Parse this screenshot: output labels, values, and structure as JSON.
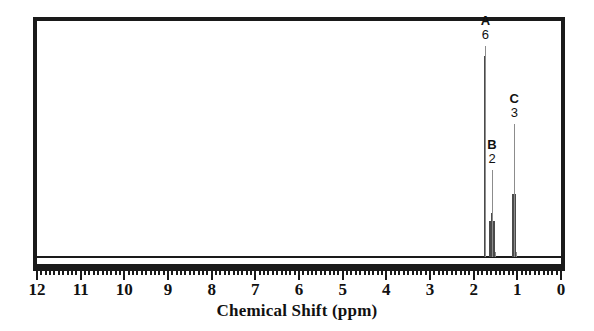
{
  "chart_data": {
    "type": "line",
    "title": "",
    "xlabel": "Chemical Shift (ppm)",
    "ylabel": "",
    "xlim": [
      12,
      0
    ],
    "x_axis_direction": "reversed",
    "grid": false,
    "legend": "none",
    "tick_labels": [
      "12",
      "11",
      "10",
      "9",
      "8",
      "7",
      "6",
      "5",
      "4",
      "3",
      "2",
      "1",
      "0"
    ],
    "tick_values": [
      12,
      11,
      10,
      9,
      8,
      7,
      6,
      5,
      4,
      3,
      2,
      1,
      0
    ],
    "minor_tick_step": 0.1,
    "baseline_level": 0,
    "peaks": [
      {
        "label": "A",
        "integration": "6",
        "shift_ppm": 1.73,
        "relative_height": 0.86,
        "multiplicity": "singlet",
        "line_count": 1
      },
      {
        "label": "B",
        "integration": "2",
        "shift_ppm": 1.58,
        "relative_height": 0.19,
        "multiplicity": "multiplet",
        "line_count": 3
      },
      {
        "label": "C",
        "integration": "3",
        "shift_ppm": 1.07,
        "relative_height": 0.33,
        "multiplicity": "doublet",
        "line_count": 2
      }
    ]
  },
  "axis": {
    "title": "Chemical Shift (ppm)",
    "labels": [
      "12",
      "11",
      "10",
      "9",
      "8",
      "7",
      "6",
      "5",
      "4",
      "3",
      "2",
      "1",
      "0"
    ]
  },
  "peak_annotations": [
    {
      "letter": "A",
      "integral": "6"
    },
    {
      "letter": "B",
      "integral": "2"
    },
    {
      "letter": "C",
      "integral": "3"
    }
  ],
  "colors": {
    "frame": "#1a1a1a",
    "trace": "#3a3a3a",
    "text": "#111111",
    "background": "#ffffff"
  }
}
